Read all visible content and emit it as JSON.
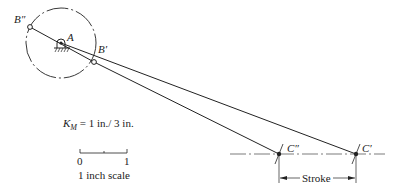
{
  "points": {
    "A": "A",
    "B_prime": "B′",
    "B_double_prime": "B″",
    "C_prime": "C′",
    "C_double_prime": "C″"
  },
  "scale_factor": {
    "symbol": "K",
    "subscript": "M",
    "value": "= 1 in./ 3 in."
  },
  "scale_bar": {
    "start": "0",
    "end": "1",
    "caption": "1 inch scale"
  },
  "stroke_label": "Stroke",
  "colors": {
    "ink": "#222222"
  }
}
